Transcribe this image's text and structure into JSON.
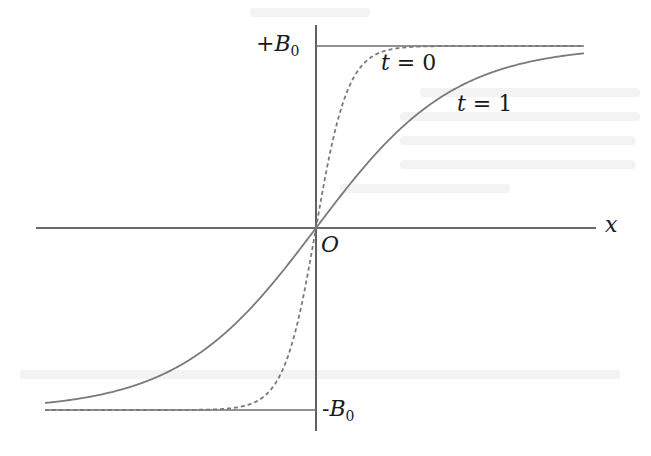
{
  "figure": {
    "axis_x_label": "x",
    "origin_label": "O",
    "top_level_label_sign": "+",
    "bottom_level_label_sign": "-",
    "level_symbol": "B",
    "level_subscript": "0",
    "curves": [
      {
        "name": "t = 0",
        "label_var": "t",
        "label_eq": " = 0",
        "style": "dashed",
        "scale_px": 32
      },
      {
        "name": "t = 1",
        "label_var": "t",
        "label_eq": " = 1",
        "style": "solid",
        "scale_px": 138
      }
    ],
    "colors": {
      "axes": "#3a3a3a",
      "curves": "#7a7a7a",
      "levels": "#6e6e6e",
      "text": "#1a1a1a"
    },
    "geometry": {
      "origin": [
        316,
        228
      ],
      "amplitude_px": 182,
      "x_axis": [
        36,
        596
      ],
      "y_axis": [
        25,
        431
      ],
      "top_level_x": [
        316,
        584
      ],
      "bottom_level_x": [
        45,
        316
      ],
      "curve_x": [
        45,
        584
      ]
    }
  }
}
